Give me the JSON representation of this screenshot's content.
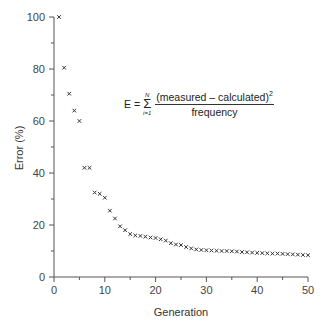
{
  "chart_data": {
    "type": "scatter",
    "title": "",
    "xlabel": "Generation",
    "ylabel": "Error (%)",
    "xlim": [
      0,
      50
    ],
    "ylim": [
      0,
      100
    ],
    "x_ticks": [
      0,
      10,
      20,
      30,
      40,
      50
    ],
    "y_ticks": [
      0,
      20,
      40,
      60,
      80,
      100
    ],
    "x_minor_ticks": [
      5,
      15,
      25,
      35,
      45
    ],
    "y_minor_ticks": [
      10,
      30,
      50,
      70,
      90
    ],
    "grid": false,
    "legend": null,
    "marker": "x",
    "annotation": {
      "text": "E = Σ_{i=1}^{N} (measured − calculated)^2 / frequency",
      "lhs": "E =",
      "sum_upper": "N",
      "sum_lower": "i=1",
      "numerator": "(measured – calculated)",
      "exponent": "2",
      "denominator": "frequency"
    },
    "x": [
      1,
      2,
      3,
      4,
      5,
      6,
      7,
      8,
      9,
      10,
      11,
      12,
      13,
      14,
      15,
      16,
      17,
      18,
      19,
      20,
      21,
      22,
      23,
      24,
      25,
      26,
      27,
      28,
      29,
      30,
      31,
      32,
      33,
      34,
      35,
      36,
      37,
      38,
      39,
      40,
      41,
      42,
      43,
      44,
      45,
      46,
      47,
      48,
      49,
      50
    ],
    "values": [
      100,
      80.5,
      70.5,
      64,
      60,
      42,
      42,
      32.5,
      32,
      30.5,
      25.5,
      22.5,
      19.5,
      18,
      16.5,
      16,
      15.8,
      15.5,
      15.2,
      15,
      14.5,
      14,
      13,
      12.5,
      12.3,
      11.5,
      11,
      10.6,
      10.4,
      10.3,
      10.2,
      10.1,
      10,
      10,
      9.9,
      9.8,
      9.6,
      9.5,
      9.4,
      9.3,
      9.2,
      9.1,
      9,
      9,
      8.9,
      8.8,
      8.7,
      8.6,
      8.5,
      8.4
    ]
  }
}
